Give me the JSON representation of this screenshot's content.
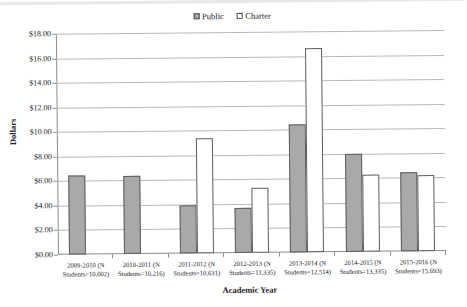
{
  "chart_data": {
    "type": "bar",
    "title": "",
    "xlabel": "Academic Year",
    "ylabel": "Dollars",
    "ylim": [
      0,
      18
    ],
    "ytick_labels": [
      "$18.00",
      "$16.00",
      "$14.00",
      "$12.00",
      "$10.00",
      "$8.00",
      "$6.00",
      "$4.00",
      "$2.00",
      "$0.00"
    ],
    "ytick_values": [
      18,
      16,
      14,
      12,
      10,
      8,
      6,
      4,
      2,
      0
    ],
    "grid": true,
    "legend_position": "top-center",
    "categories": [
      "2009-2010 (N Students=10,002)",
      "2010-2011 (N Students=10,216)",
      "2011-2012 (N Students=10,631)",
      "2012-2013 (N Students=11,335)",
      "2013-2014 (N Students=12,514)",
      "2014-2015 (N Students=13,335)",
      "2015-2016 (N Students=15,693)"
    ],
    "category_lines": [
      [
        "2009-2010 (N",
        "Students=10,002)"
      ],
      [
        "2010-2011 (N",
        "Students=10,216)"
      ],
      [
        "2011-2012 (N",
        "Students=10,631)"
      ],
      [
        "2012-2013 (N",
        "Students=11,335)"
      ],
      [
        "2013-2014 (N",
        "Students=12,514)"
      ],
      [
        "2014-2015 (N",
        "Students=13,335)"
      ],
      [
        "2015-2016 (N",
        "Students=15,693)"
      ]
    ],
    "series": [
      {
        "name": "Public",
        "color": "#a9a9a9",
        "values": [
          6.45,
          6.35,
          3.9,
          3.7,
          10.45,
          7.95,
          6.45
        ]
      },
      {
        "name": "Charter",
        "color": "#ffffff",
        "values": [
          null,
          null,
          9.35,
          5.3,
          16.65,
          6.3,
          6.2
        ]
      }
    ]
  },
  "legend": {
    "items": [
      {
        "label": "Public"
      },
      {
        "label": "Charter"
      }
    ]
  }
}
